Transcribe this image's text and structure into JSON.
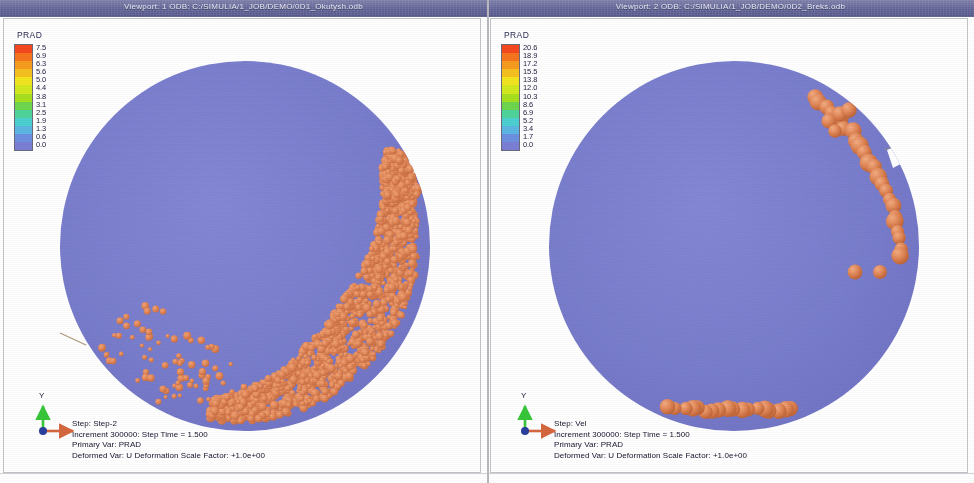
{
  "window": {
    "background_color": "#ffffff",
    "divider_color": "#b9b9bd"
  },
  "panels": [
    {
      "id": "viewport-1",
      "title": "Viewport: 1    ODB: C:/SIMULIA/1_JOB/DEMO/0D1_Okutysh.odb",
      "legend": {
        "title": "PRAD",
        "labels": [
          "7.5",
          "6.9",
          "6.3",
          "5.6",
          "5.0",
          "4.4",
          "3.8",
          "3.1",
          "2.5",
          "1.9",
          "1.3",
          "0.6",
          "0.0"
        ],
        "colors": [
          "#f6481f",
          "#f7741f",
          "#f79b1f",
          "#f5c01f",
          "#f2e41e",
          "#d3e81f",
          "#a8e01f",
          "#6ed64e",
          "#4ed39a",
          "#4ccfd1",
          "#5bb6e2",
          "#6d8fe0",
          "#7a7fd4"
        ]
      },
      "triad": {
        "y_label": "Y",
        "x_axis_color": "#d4673f",
        "y_axis_color": "#38c63a",
        "origin_color": "#2a3f9e"
      },
      "status": {
        "line1": "Step:  Step-2",
        "line2": "Increment    300000: Step Time =    1.500",
        "line3": "Primary Var: PRAD",
        "line4": "Deformed Var: U   Deformation Scale Factor: +1.0e+00"
      },
      "specimen": {
        "disc_color": "#7b7fcf",
        "particle_color": "#e08758",
        "particle_style": "dense-fine",
        "notch_angle_deg": -22
      }
    },
    {
      "id": "viewport-2",
      "title": "Viewport: 2    ODB: C:/SIMULIA/1_JOB/DEMO/0D2_Breks.odb",
      "legend": {
        "title": "PRAD",
        "labels": [
          "20.6",
          "18.9",
          "17.2",
          "15.5",
          "13.8",
          "12.0",
          "10.3",
          "8.6",
          "6.9",
          "5.2",
          "3.4",
          "1.7",
          "0.0"
        ],
        "colors": [
          "#f6481f",
          "#f7741f",
          "#f79b1f",
          "#f5c01f",
          "#f2e41e",
          "#d3e81f",
          "#a8e01f",
          "#6ed64e",
          "#4ed39a",
          "#4ccfd1",
          "#5bb6e2",
          "#6d8fe0",
          "#7a7fd4"
        ]
      },
      "triad": {
        "y_label": "Y",
        "x_axis_color": "#d4673f",
        "y_axis_color": "#38c63a",
        "origin_color": "#2a3f9e"
      },
      "status": {
        "line1": "Step:  Vel",
        "line2": "Increment    300000: Step Time =    1.500",
        "line3": "Primary Var: PRAD",
        "line4": "Deformed Var: U   Deformation Scale Factor: +1.0e+00"
      },
      "specimen": {
        "disc_color": "#7b7fcf",
        "particle_color": "#e08758",
        "particle_style": "coarse-spheres",
        "notch_angle_deg": -22
      }
    }
  ]
}
